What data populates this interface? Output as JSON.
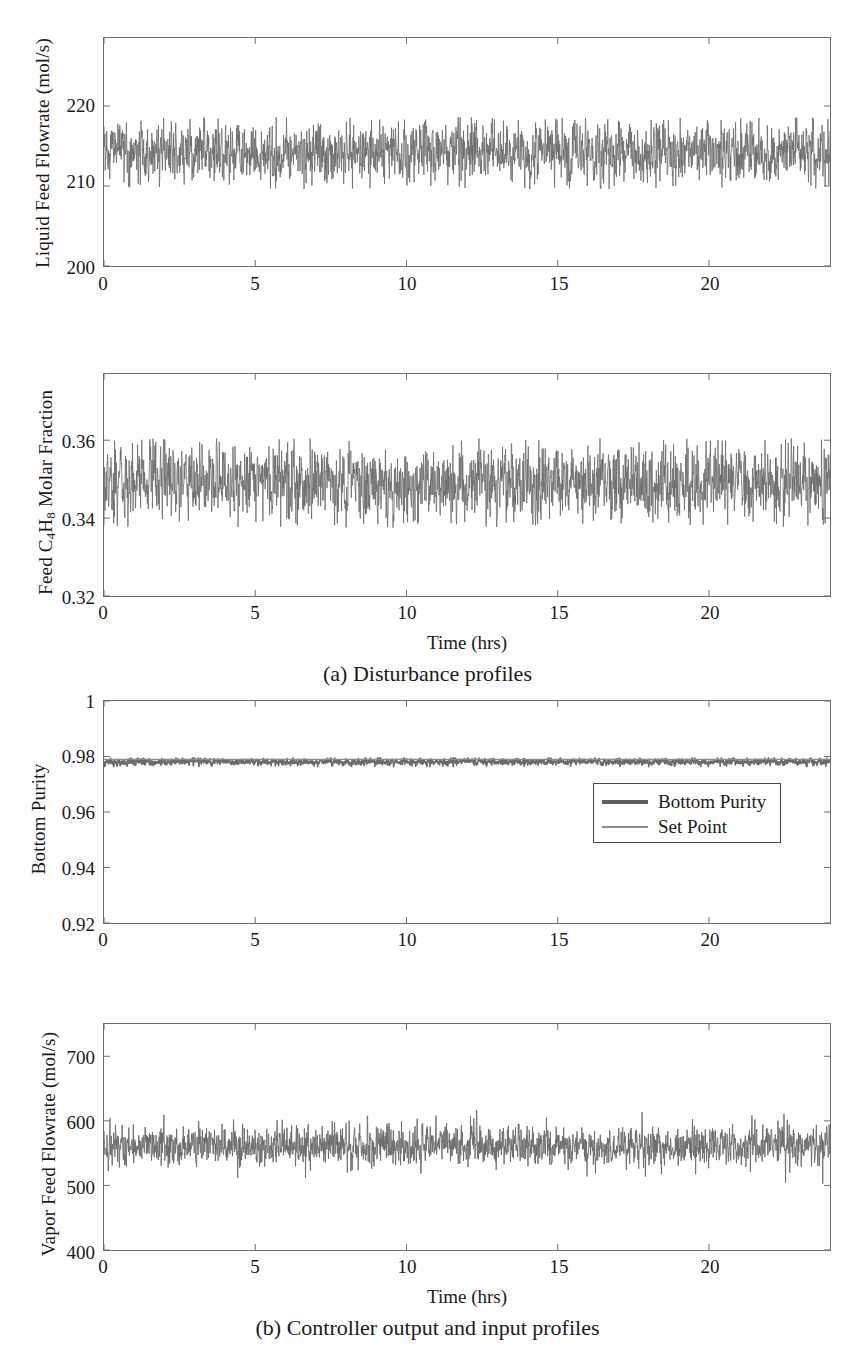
{
  "figure": {
    "background": "#ffffff",
    "line_color": "#6b6b6b",
    "setpoint_color": "#8d8d8d",
    "axis_color": "#6d6d6d"
  },
  "subfigures": [
    {
      "id": "a",
      "caption": "(a) Disturbance profiles"
    },
    {
      "id": "b",
      "caption": "(b) Controller output and input profiles"
    }
  ],
  "chart_data": [
    {
      "type": "line",
      "title": "",
      "panel": "a-top",
      "xlabel": "",
      "ylabel": "Liquid Feed Flowrate (mol/s)",
      "ylabel_parts": [
        "Liquid Feed Flowrate (mol/s)"
      ],
      "xlim": [
        0,
        24
      ],
      "ylim": [
        200,
        228.5
      ],
      "xticks": [
        0,
        5,
        10,
        15,
        20
      ],
      "xticklabels": [
        "0",
        "5",
        "10",
        "15",
        "20"
      ],
      "yticks": [
        200,
        210,
        220
      ],
      "yticklabels": [
        "200",
        "210",
        "220"
      ],
      "grid": false,
      "legend": null,
      "series": [
        {
          "name": "Liquid Feed Flowrate",
          "color": "#6b6b6b",
          "linewidth": 0.8,
          "mean": 214.2,
          "band_min": 209.6,
          "band_max": 218.6,
          "noise_sigma": 2.4,
          "n_points": 2400,
          "seed": 11
        }
      ]
    },
    {
      "type": "line",
      "title": "",
      "panel": "a-bottom",
      "xlabel": "Time (hrs)",
      "ylabel": "Feed C4H8 Molar Fraction",
      "ylabel_parts": [
        "Feed C",
        "4",
        "H",
        "8",
        " Molar Fraction"
      ],
      "xlim": [
        0,
        24
      ],
      "ylim": [
        0.32,
        0.377
      ],
      "xticks": [
        0,
        5,
        10,
        15,
        20
      ],
      "xticklabels": [
        "0",
        "5",
        "10",
        "15",
        "20"
      ],
      "yticks": [
        0.32,
        0.34,
        0.36
      ],
      "yticklabels": [
        "0.32",
        "0.34",
        "0.36"
      ],
      "grid": false,
      "legend": null,
      "series": [
        {
          "name": "Feed C4H8 Molar Fraction",
          "color": "#6b6b6b",
          "linewidth": 0.8,
          "mean": 0.349,
          "band_min": 0.3375,
          "band_max": 0.3605,
          "noise_sigma": 0.0062,
          "n_points": 2400,
          "seed": 23
        }
      ]
    },
    {
      "type": "line",
      "title": "",
      "panel": "b-top",
      "xlabel": "",
      "ylabel": "Bottom Purity",
      "ylabel_parts": [
        "Bottom Purity"
      ],
      "xlim": [
        0,
        24
      ],
      "ylim": [
        0.92,
        1.0
      ],
      "xticks": [
        0,
        5,
        10,
        15,
        20
      ],
      "xticklabels": [
        "0",
        "5",
        "10",
        "15",
        "20"
      ],
      "yticks": [
        0.92,
        0.94,
        0.96,
        0.98,
        1.0
      ],
      "yticklabels": [
        "0.92",
        "0.94",
        "0.96",
        "0.98",
        "1"
      ],
      "grid": false,
      "legend": {
        "position": "center-right",
        "entries": [
          {
            "label": "Bottom Purity",
            "color": "#5f5f5f",
            "linewidth": 4
          },
          {
            "label": "Set Point",
            "color": "#8d8d8d",
            "linewidth": 2
          }
        ]
      },
      "series": [
        {
          "name": "Bottom Purity",
          "color": "#6b6b6b",
          "linewidth": 1.6,
          "mean": 0.9781,
          "band_min": 0.9763,
          "band_max": 0.9795,
          "noise_sigma": 0.0008,
          "n_points": 2400,
          "seed": 37
        },
        {
          "name": "Set Point",
          "color": "#8d8d8d",
          "linewidth": 1.2,
          "constant": 0.979
        }
      ]
    },
    {
      "type": "line",
      "title": "",
      "panel": "b-bottom",
      "xlabel": "Time (hrs)",
      "ylabel": "Vapor Feed Flowrate (mol/s)",
      "ylabel_parts": [
        "Vapor Feed Flowrate (mol/s)"
      ],
      "xlim": [
        0,
        24
      ],
      "ylim": [
        400,
        750
      ],
      "xticks": [
        0,
        5,
        10,
        15,
        20
      ],
      "xticklabels": [
        "0",
        "5",
        "10",
        "15",
        "20"
      ],
      "yticks": [
        400,
        500,
        600,
        700
      ],
      "yticklabels": [
        "400",
        "500",
        "600",
        "700"
      ],
      "grid": false,
      "legend": null,
      "series": [
        {
          "name": "Vapor Feed Flowrate",
          "color": "#6b6b6b",
          "linewidth": 0.9,
          "mean": 561,
          "band_min": 500,
          "band_max": 622,
          "noise_sigma": 19,
          "n_points": 2400,
          "seed": 53
        }
      ]
    }
  ]
}
